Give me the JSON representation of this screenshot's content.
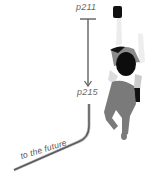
{
  "timeline": {
    "start_label": "p211",
    "end_label": "p215",
    "future_label": "to the future"
  },
  "colors": {
    "line": "#6a6a6a",
    "line_highlight": "#bdbdbd",
    "label": "#666666",
    "figure_dark": "#111111",
    "figure_mid": "#7a7a7a",
    "figure_light": "#e8e8e8",
    "background": "#ffffff"
  }
}
